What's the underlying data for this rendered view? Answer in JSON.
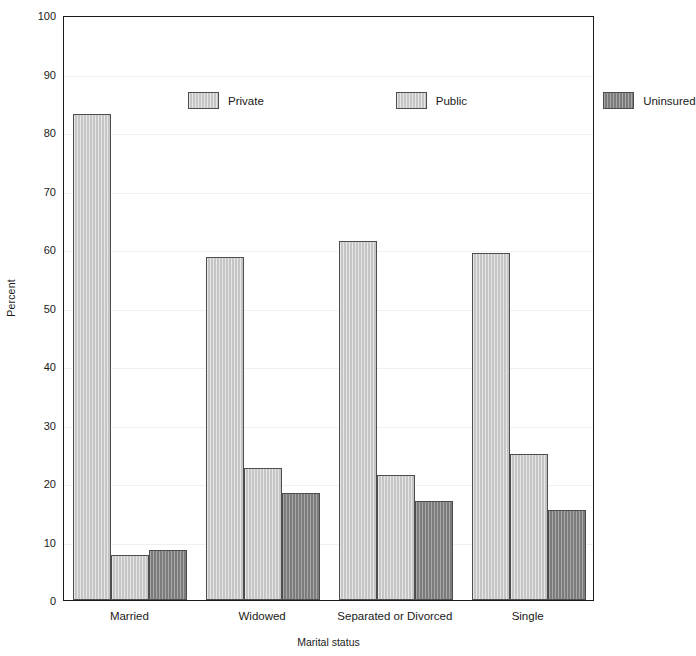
{
  "chart_data": {
    "type": "bar",
    "title": "",
    "xlabel": "Marital status",
    "ylabel": "Percent",
    "ylim": [
      0,
      100
    ],
    "ytick_step": 10,
    "yticks": [
      100,
      90,
      80,
      70,
      60,
      50,
      40,
      30,
      20,
      10,
      0
    ],
    "ytick_labels": [
      "100",
      "90",
      "80",
      "70",
      "60",
      "50",
      "40",
      "30",
      "20",
      "10",
      "0"
    ],
    "grid": true,
    "grid_axis": "y",
    "legend_position": "upper center",
    "categories": [
      "Married",
      "Widowed",
      "Separated or Divorced",
      "Single"
    ],
    "series": [
      {
        "name": "Private",
        "color": "#c9c9c9",
        "values": [
          83.0,
          58.6,
          61.4,
          59.4
        ]
      },
      {
        "name": "Public",
        "color": "#c9c9c9",
        "values": [
          7.7,
          22.6,
          21.4,
          25.0
        ]
      },
      {
        "name": "Uninsured",
        "color": "#818181",
        "values": [
          8.6,
          18.3,
          16.9,
          15.4
        ]
      }
    ]
  },
  "axes": {
    "y_title": "Percent",
    "x_title": "Marital status"
  },
  "legend": {
    "entries": [
      {
        "label": "Private",
        "color": "#c9c9c9"
      },
      {
        "label": "Public",
        "color": "#c9c9c9"
      },
      {
        "label": "Uninsured",
        "color": "#818181"
      }
    ]
  },
  "colors": {
    "axis": "#1a1a1a",
    "grid": "#f0f0f0",
    "bar_outline": "#4d4d4d",
    "background": "#ffffff"
  }
}
